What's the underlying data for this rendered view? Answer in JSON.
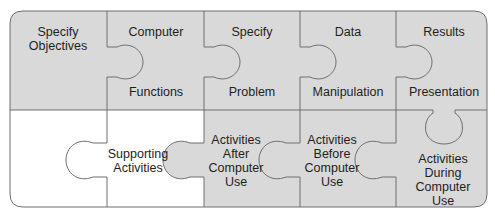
{
  "colors": {
    "gray_fill": "#d9d9d9",
    "white_fill": "#ffffff",
    "outline": "#6e6e6e",
    "text": "#1e1e1e"
  },
  "top_row": [
    {
      "id": "specify-objectives",
      "lines": [
        "Specify",
        "Objectives"
      ]
    },
    {
      "id": "computer-functions",
      "top": "Computer",
      "bottom": "Functions"
    },
    {
      "id": "specify-problem",
      "top": "Specify",
      "bottom": "Problem"
    },
    {
      "id": "data-manipulation",
      "top": "Data",
      "bottom": "Manipulation"
    },
    {
      "id": "results-presentation",
      "top": "Results",
      "bottom": "Presentation"
    }
  ],
  "bottom_row": [
    {
      "id": "supporting-activities",
      "lines": [
        "Supporting",
        "Activities"
      ]
    },
    {
      "id": "activities-after",
      "lines": [
        "Activities",
        "After",
        "Computer",
        "Use"
      ]
    },
    {
      "id": "activities-before",
      "lines": [
        "Activities",
        "Before",
        "Computer",
        "Use"
      ]
    },
    {
      "id": "activities-during",
      "lines": [
        "Activities",
        "During",
        "Computer",
        "Use"
      ]
    }
  ]
}
